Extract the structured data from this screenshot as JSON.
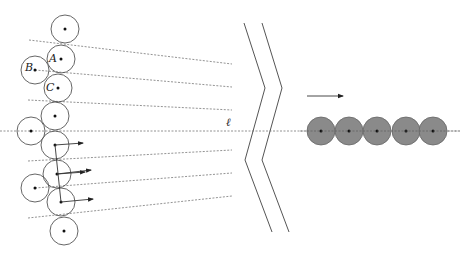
{
  "diagram": {
    "colors": {
      "stroke": "#555555",
      "dash": "#777777",
      "fill_gray": "#8a8a8a",
      "dot": "#111111"
    },
    "labels": [
      {
        "id": "A",
        "text": "A",
        "x": 49,
        "y": 53
      },
      {
        "id": "B",
        "text": "B",
        "x": 25,
        "y": 62
      },
      {
        "id": "C",
        "text": "C",
        "x": 46,
        "y": 82
      },
      {
        "id": "ell",
        "text": "ℓ",
        "x": 226,
        "y": 117
      }
    ],
    "left_circles": [
      {
        "cx": 65,
        "cy": 29,
        "r": 14
      },
      {
        "cx": 61,
        "cy": 59,
        "r": 14
      },
      {
        "cx": 35,
        "cy": 70,
        "r": 14
      },
      {
        "cx": 58,
        "cy": 88,
        "r": 14
      },
      {
        "cx": 55,
        "cy": 116,
        "r": 14
      },
      {
        "cx": 31,
        "cy": 131,
        "r": 14
      },
      {
        "cx": 55,
        "cy": 145,
        "r": 14
      },
      {
        "cx": 57,
        "cy": 174,
        "r": 14
      },
      {
        "cx": 35,
        "cy": 188,
        "r": 14
      },
      {
        "cx": 61,
        "cy": 202,
        "r": 14
      },
      {
        "cx": 64,
        "cy": 231,
        "r": 14
      }
    ],
    "right_circles": [
      {
        "cx": 321,
        "cy": 131,
        "r": 14
      },
      {
        "cx": 349,
        "cy": 131,
        "r": 14
      },
      {
        "cx": 377,
        "cy": 131,
        "r": 14
      },
      {
        "cx": 406,
        "cy": 131,
        "r": 14
      },
      {
        "cx": 433,
        "cy": 131,
        "r": 14
      }
    ],
    "dashed_lines": [
      {
        "x1": 29,
        "y1": 40,
        "x2": 232,
        "y2": 64
      },
      {
        "x1": 35,
        "y1": 70,
        "x2": 232,
        "y2": 87
      },
      {
        "x1": 28,
        "y1": 100,
        "x2": 232,
        "y2": 110
      },
      {
        "x1": 0,
        "y1": 131,
        "x2": 460,
        "y2": 131
      },
      {
        "x1": 28,
        "y1": 161,
        "x2": 232,
        "y2": 150
      },
      {
        "x1": 35,
        "y1": 188,
        "x2": 232,
        "y2": 173
      },
      {
        "x1": 28,
        "y1": 218,
        "x2": 232,
        "y2": 196
      }
    ],
    "zigzags": [
      {
        "points": "244,23 265,88 245,160 272,232"
      },
      {
        "points": "262,23 282,88 262,160 289,232"
      }
    ],
    "arrows": [
      {
        "x1": 55,
        "y1": 145,
        "x2": 83,
        "y2": 143
      },
      {
        "x1": 57,
        "y1": 174,
        "x2": 91,
        "y2": 170
      },
      {
        "x1": 57,
        "y1": 174,
        "x2": 85,
        "y2": 172
      },
      {
        "x1": 61,
        "y1": 202,
        "x2": 93,
        "y2": 199
      },
      {
        "x1": 307,
        "y1": 96,
        "x2": 343,
        "y2": 96
      }
    ],
    "solid_segments": [
      {
        "x1": 55,
        "y1": 145,
        "x2": 61,
        "y2": 202
      }
    ]
  }
}
